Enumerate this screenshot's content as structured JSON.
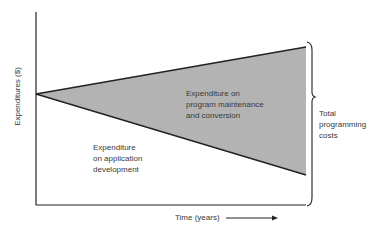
{
  "diagram": {
    "y_axis_label": "Expenditures ($)",
    "x_axis_label": "Time (years)",
    "regions": {
      "maintenance": {
        "line1": "Expenditure on",
        "line2": "program maintenance",
        "line3": "and conversion",
        "fill": "#b3b3b3"
      },
      "development": {
        "line1": "Expenditure",
        "line2": "on application",
        "line3": "development"
      }
    },
    "brace_label": {
      "line1": "Total",
      "line2": "programming",
      "line3": "costs"
    }
  }
}
